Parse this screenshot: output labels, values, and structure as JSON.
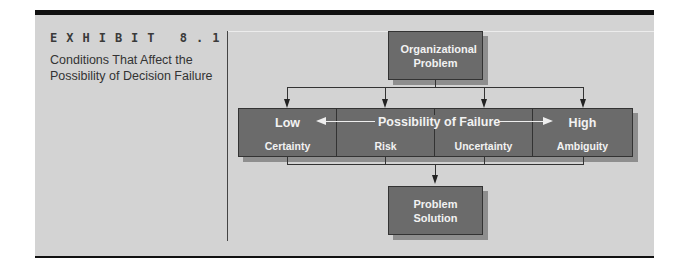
{
  "exhibit": {
    "label": "EXHIBIT 8.1",
    "title": "Conditions That Affect the Possibility of Decision Failure"
  },
  "diagram": {
    "top_box": "Organizational Problem",
    "bottom_box": "Problem Solution",
    "scale": {
      "low_label": "Low",
      "center_label": "Possibility of Failure",
      "high_label": "High"
    },
    "conditions": [
      "Certainty",
      "Risk",
      "Uncertainty",
      "Ambiguity"
    ]
  },
  "colors": {
    "panel_bg": "#d3d3d3",
    "box_fill": "#6b6b6b",
    "box_text": "#f2f2f2",
    "rule": "#111111"
  }
}
